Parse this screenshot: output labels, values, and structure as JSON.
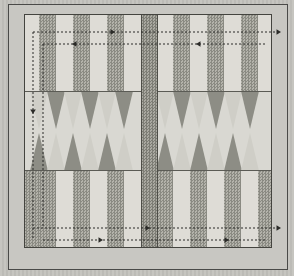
{
  "figure": {
    "kind": "backgammon-board-diagram",
    "title": "Backgammon board with movement direction paths",
    "background_color": "#c3c2bd",
    "board_color": "#d6d5cf",
    "frame_color": "#44443f",
    "band_dark_color": "#8d8d85",
    "band_light_color": "#dedcd6",
    "center_bar_color": "#83837b",
    "path_color": "#2b2b28"
  },
  "board": {
    "outer_frame": {
      "x": 8,
      "y": 4,
      "width": 278,
      "height": 264
    },
    "play_area": {
      "x": 24,
      "y": 14,
      "width": 246,
      "height": 232
    },
    "center_bar": {
      "x": 116,
      "width": 15
    },
    "top_tray_height": 76,
    "bottom_tray_top": 156,
    "bottom_tray_height": 76,
    "points_band": {
      "top": 76,
      "height": 80
    }
  },
  "bands": {
    "top": [
      {
        "x": 0,
        "width": 14,
        "shade": "light"
      },
      {
        "x": 14,
        "width": 17,
        "shade": "dark"
      },
      {
        "x": 31,
        "width": 17,
        "shade": "light"
      },
      {
        "x": 48,
        "width": 17,
        "shade": "dark"
      },
      {
        "x": 65,
        "width": 17,
        "shade": "light"
      },
      {
        "x": 82,
        "width": 17,
        "shade": "dark"
      },
      {
        "x": 99,
        "width": 17,
        "shade": "light"
      },
      {
        "x": 131,
        "width": 17,
        "shade": "light"
      },
      {
        "x": 148,
        "width": 17,
        "shade": "dark"
      },
      {
        "x": 165,
        "width": 17,
        "shade": "light"
      },
      {
        "x": 182,
        "width": 17,
        "shade": "dark"
      },
      {
        "x": 199,
        "width": 17,
        "shade": "light"
      },
      {
        "x": 216,
        "width": 17,
        "shade": "dark"
      },
      {
        "x": 233,
        "width": 13,
        "shade": "light"
      }
    ],
    "bottom": [
      {
        "x": 0,
        "width": 14,
        "shade": "dark"
      },
      {
        "x": 14,
        "width": 17,
        "shade": "dark"
      },
      {
        "x": 31,
        "width": 17,
        "shade": "light"
      },
      {
        "x": 48,
        "width": 17,
        "shade": "dark"
      },
      {
        "x": 65,
        "width": 17,
        "shade": "light"
      },
      {
        "x": 82,
        "width": 17,
        "shade": "dark"
      },
      {
        "x": 99,
        "width": 17,
        "shade": "light"
      },
      {
        "x": 131,
        "width": 17,
        "shade": "dark"
      },
      {
        "x": 148,
        "width": 17,
        "shade": "light"
      },
      {
        "x": 165,
        "width": 17,
        "shade": "dark"
      },
      {
        "x": 182,
        "width": 17,
        "shade": "light"
      },
      {
        "x": 199,
        "width": 17,
        "shade": "dark"
      },
      {
        "x": 216,
        "width": 17,
        "shade": "light"
      },
      {
        "x": 233,
        "width": 13,
        "shade": "dark"
      }
    ]
  },
  "points": {
    "count_per_quadrant": 6,
    "height": 38,
    "half_width": 9,
    "top_row": [
      {
        "cx": 14,
        "shade": "light"
      },
      {
        "cx": 31,
        "shade": "dark"
      },
      {
        "cx": 48,
        "shade": "light"
      },
      {
        "cx": 65,
        "shade": "dark"
      },
      {
        "cx": 82,
        "shade": "light"
      },
      {
        "cx": 99,
        "shade": "dark"
      },
      {
        "cx": 140,
        "shade": "light"
      },
      {
        "cx": 157,
        "shade": "dark"
      },
      {
        "cx": 174,
        "shade": "light"
      },
      {
        "cx": 191,
        "shade": "dark"
      },
      {
        "cx": 208,
        "shade": "light"
      },
      {
        "cx": 225,
        "shade": "dark"
      }
    ],
    "bottom_row": [
      {
        "cx": 14,
        "shade": "dark"
      },
      {
        "cx": 31,
        "shade": "light"
      },
      {
        "cx": 48,
        "shade": "dark"
      },
      {
        "cx": 65,
        "shade": "light"
      },
      {
        "cx": 82,
        "shade": "dark"
      },
      {
        "cx": 99,
        "shade": "light"
      },
      {
        "cx": 140,
        "shade": "dark"
      },
      {
        "cx": 157,
        "shade": "light"
      },
      {
        "cx": 174,
        "shade": "dark"
      },
      {
        "cx": 191,
        "shade": "light"
      },
      {
        "cx": 208,
        "shade": "dark"
      },
      {
        "cx": 225,
        "shade": "light"
      }
    ]
  },
  "paths": {
    "style": "dashed",
    "dash": "2,2",
    "stroke_width": 1,
    "segments": [
      {
        "name": "outer-top-horizontal",
        "x1": 33,
        "y1": 32,
        "x2": 281,
        "y2": 32,
        "arrow": "right-end"
      },
      {
        "name": "inner-top-horizontal",
        "x1": 43,
        "y1": 44,
        "x2": 266,
        "y2": 44,
        "arrow": "left-mid"
      },
      {
        "name": "outer-left-vertical",
        "x1": 33,
        "y1": 32,
        "x2": 33,
        "y2": 240,
        "arrow": "down-mid"
      },
      {
        "name": "inner-left-vertical",
        "x1": 43,
        "y1": 44,
        "x2": 43,
        "y2": 228,
        "arrow": "none"
      },
      {
        "name": "outer-bottom-horizontal",
        "x1": 33,
        "y1": 228,
        "x2": 281,
        "y2": 228,
        "arrow": "right-end"
      },
      {
        "name": "inner-bottom-horizontal",
        "x1": 43,
        "y1": 240,
        "x2": 266,
        "y2": 240,
        "arrow": "right-mid"
      }
    ],
    "arrowheads": [
      {
        "name": "top-outer-right-exit",
        "x": 281,
        "y": 32,
        "dir": "right"
      },
      {
        "name": "top-outer-mid",
        "x": 115,
        "y": 32,
        "dir": "right"
      },
      {
        "name": "top-inner-left",
        "x": 196,
        "y": 44,
        "dir": "left"
      },
      {
        "name": "top-inner-mid-left",
        "x": 72,
        "y": 44,
        "dir": "left"
      },
      {
        "name": "left-down",
        "x": 33,
        "y": 114,
        "dir": "down"
      },
      {
        "name": "bottom-outer-right",
        "x": 281,
        "y": 228,
        "dir": "right"
      },
      {
        "name": "bottom-outer-mid",
        "x": 150,
        "y": 228,
        "dir": "right"
      },
      {
        "name": "bottom-inner-mid",
        "x": 103,
        "y": 240,
        "dir": "right"
      },
      {
        "name": "bottom-inner-right",
        "x": 229,
        "y": 240,
        "dir": "right"
      }
    ]
  }
}
